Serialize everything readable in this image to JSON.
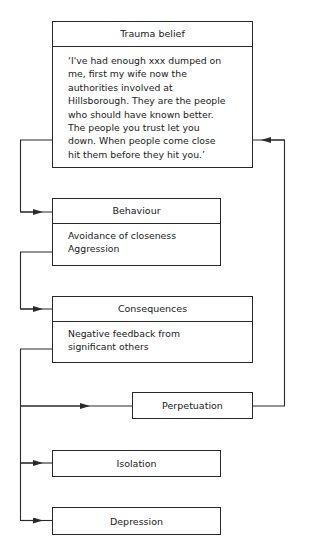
{
  "diagram": {
    "trauma_belief": {
      "title": "Trauma belief",
      "text": "‘I've had enough xxx dumped on\nme, first my wife now the\nauthorities involved at\nHillsborough. They are the people\nwho should have known better.\nThe people you trust let you\ndown. When people come close\nhit them before they hit you.’"
    },
    "behaviour": {
      "title": "Behaviour",
      "text": "Avoidance of closeness\nAggression"
    },
    "consequences": {
      "title": "Consequences",
      "text": "Negative feedback from\nsignificant others"
    },
    "perpetuation": {
      "title": "Perpetuation"
    },
    "isolation": {
      "title": "Isolation"
    },
    "depression": {
      "title": "Depression"
    },
    "edges": [
      {
        "from": "Trauma belief",
        "to": "Behaviour"
      },
      {
        "from": "Behaviour",
        "to": "Consequences"
      },
      {
        "from": "Consequences",
        "to": "Perpetuation"
      },
      {
        "from": "Consequences",
        "to": "Isolation"
      },
      {
        "from": "Consequences",
        "to": "Depression"
      },
      {
        "from": "Perpetuation",
        "to": "Trauma belief"
      }
    ],
    "colors": {
      "line": "#2a2a2a",
      "background": "#ffffff"
    }
  }
}
